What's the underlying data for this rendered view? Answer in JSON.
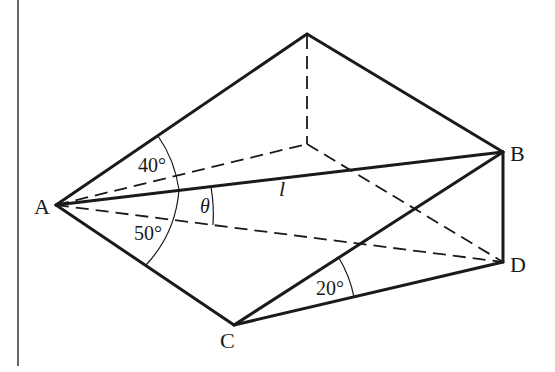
{
  "figure": {
    "points": {
      "A": "A",
      "B": "B",
      "C": "C",
      "D": "D"
    },
    "line_labels": {
      "l": "l"
    },
    "angles": {
      "upper_at_A": "40°",
      "lower_at_A": "50°",
      "theta": "θ",
      "at_C": "20°"
    }
  }
}
